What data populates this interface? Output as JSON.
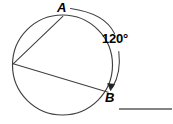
{
  "figure": {
    "type": "geometry-diagram",
    "stroke_color": "#3a3a3a",
    "label_color": "#000000",
    "background_color": "#ffffff",
    "circle": {
      "center_x": 62.5,
      "center_y": 65,
      "radius": 50
    },
    "points": [
      {
        "id": "A",
        "label": "A",
        "x": 63,
        "y": 16
      },
      {
        "id": "B",
        "label": "B",
        "x": 108,
        "y": 92
      },
      {
        "id": "V",
        "label": "",
        "x": 13,
        "y": 64
      }
    ],
    "chords": [
      {
        "from": "V",
        "to": "A"
      },
      {
        "from": "V",
        "to": "B"
      }
    ],
    "arc": {
      "label": "120°",
      "measure": 120,
      "unit": "degrees",
      "from": "A",
      "to": "B",
      "direction": "clockwise",
      "arrowheads": [
        "end"
      ]
    },
    "answer_blank": {
      "x1": 119,
      "x2": 172,
      "y": 109
    }
  }
}
